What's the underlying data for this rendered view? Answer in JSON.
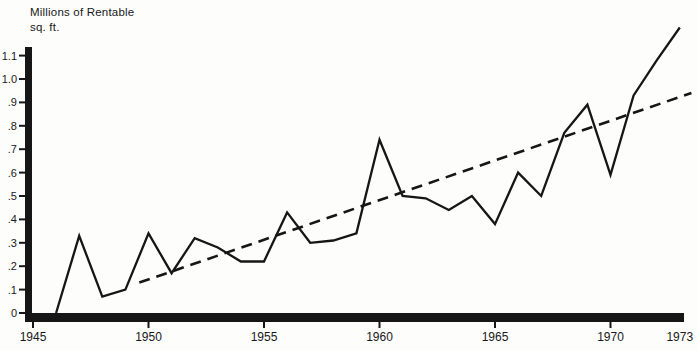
{
  "chart_data": {
    "type": "line",
    "title_lines": [
      "Millions of Rentable",
      "sq. ft."
    ],
    "ylabel": "Millions of Rentable sq. ft.",
    "ylim": [
      0,
      1.1
    ],
    "xlim": [
      1945,
      1973
    ],
    "grid": false,
    "legend": "none",
    "colors": {
      "ink": "#161616",
      "background": "#fdfdfc"
    },
    "y_ticks": [
      0,
      0.1,
      0.2,
      0.3,
      0.4,
      0.5,
      0.6,
      0.7,
      0.8,
      0.9,
      1.0,
      1.1
    ],
    "y_tick_labels": [
      "0",
      ".1",
      ".2",
      ".3",
      ".4",
      ".5",
      ".6",
      ".7",
      ".8",
      ".9",
      "1.0",
      "1.1"
    ],
    "x_tick_labels": [
      "1945",
      "1950",
      "1955",
      "1960",
      "1965",
      "1970",
      "1973"
    ],
    "x_tick_years": [
      1945,
      1950,
      1955,
      1960,
      1965,
      1970,
      1973
    ],
    "x_tick_marks": [
      1945,
      1950,
      1955,
      1960,
      1965,
      1970
    ],
    "series": [
      {
        "name": "rentable-space-annual",
        "style": "solid",
        "x": [
          1946,
          1947,
          1948,
          1949,
          1950,
          1951,
          1952,
          1953,
          1954,
          1955,
          1956,
          1957,
          1958,
          1959,
          1960,
          1961,
          1962,
          1963,
          1964,
          1965,
          1966,
          1967,
          1968,
          1969,
          1970,
          1971,
          1972,
          1973
        ],
        "values": [
          0,
          0.33,
          0.07,
          0.1,
          0.34,
          0.17,
          0.32,
          0.28,
          0.22,
          0.22,
          0.43,
          0.3,
          0.31,
          0.34,
          0.74,
          0.5,
          0.49,
          0.44,
          0.5,
          0.38,
          0.6,
          0.5,
          0.77,
          0.89,
          0.59,
          0.93,
          1.08,
          1.22
        ]
      },
      {
        "name": "trend-line",
        "style": "dashed",
        "x": [
          1949.6,
          1973.5
        ],
        "values": [
          0.13,
          0.94
        ]
      }
    ]
  }
}
